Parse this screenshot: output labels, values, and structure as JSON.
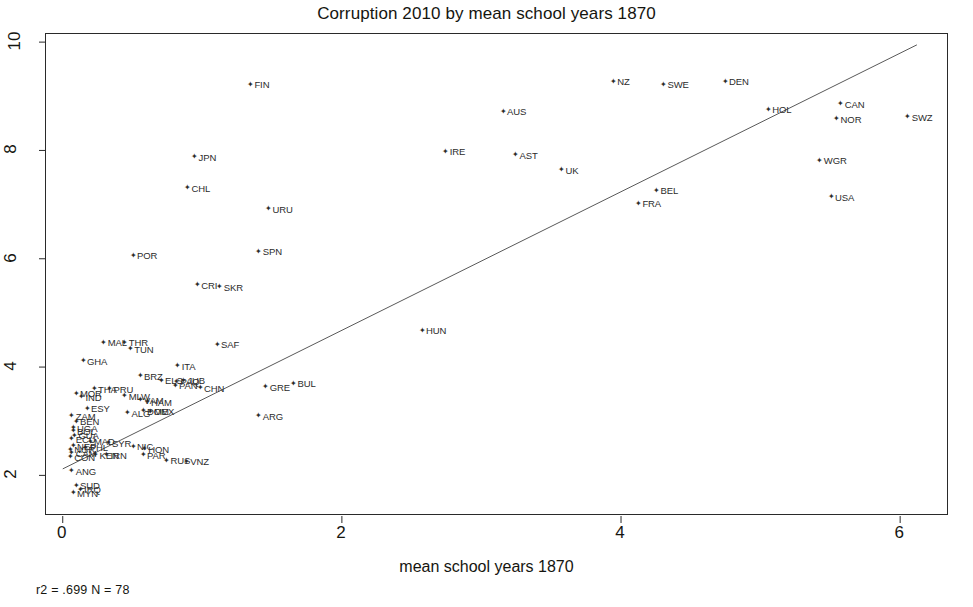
{
  "chart_data": {
    "type": "scatter",
    "title": "Corruption 2010 by mean school years 1870",
    "xlabel": "mean school years 1870",
    "ylabel": "",
    "xlim": [
      -0.12,
      6.35
    ],
    "ylim": [
      1.25,
      10.15
    ],
    "xticks": [
      0,
      2,
      4,
      6
    ],
    "yticks": [
      2,
      4,
      6,
      8,
      10
    ],
    "grid": false,
    "legend": null,
    "annotation": "r2 = .699  N = 78",
    "r2": ".699",
    "n": "78",
    "trendline": {
      "x0": 0.0,
      "y0": 2.12,
      "x1": 6.12,
      "y1": 9.95
    },
    "marker": "✦",
    "point_label_position": "right",
    "points": [
      {
        "label": "FIN",
        "x": 1.32,
        "y": 9.22
      },
      {
        "label": "NZ",
        "x": 3.92,
        "y": 9.28
      },
      {
        "label": "SWE",
        "x": 4.28,
        "y": 9.22
      },
      {
        "label": "DEN",
        "x": 4.72,
        "y": 9.28
      },
      {
        "label": "AUS",
        "x": 3.13,
        "y": 8.72
      },
      {
        "label": "HOL",
        "x": 5.03,
        "y": 8.76
      },
      {
        "label": "CAN",
        "x": 5.55,
        "y": 8.86
      },
      {
        "label": "NOR",
        "x": 5.52,
        "y": 8.58
      },
      {
        "label": "SWZ",
        "x": 6.03,
        "y": 8.62
      },
      {
        "label": "IRE",
        "x": 2.72,
        "y": 7.98
      },
      {
        "label": "AST",
        "x": 3.22,
        "y": 7.92
      },
      {
        "label": "JPN",
        "x": 0.92,
        "y": 7.88
      },
      {
        "label": "WGR",
        "x": 5.4,
        "y": 7.82
      },
      {
        "label": "UK",
        "x": 3.55,
        "y": 7.64
      },
      {
        "label": "CHL",
        "x": 0.87,
        "y": 7.31
      },
      {
        "label": "BEL",
        "x": 4.23,
        "y": 7.26
      },
      {
        "label": "USA",
        "x": 5.48,
        "y": 7.14
      },
      {
        "label": "URU",
        "x": 1.45,
        "y": 6.92
      },
      {
        "label": "FRA",
        "x": 4.1,
        "y": 7.02
      },
      {
        "label": "SPN",
        "x": 1.38,
        "y": 6.14
      },
      {
        "label": "POR",
        "x": 0.48,
        "y": 6.06
      },
      {
        "label": "CRI",
        "x": 0.94,
        "y": 5.52
      },
      {
        "label": "SKR",
        "x": 1.1,
        "y": 5.48
      },
      {
        "label": "HUN",
        "x": 2.55,
        "y": 4.68
      },
      {
        "label": "SAF",
        "x": 1.08,
        "y": 4.42
      },
      {
        "label": "MAL",
        "x": 0.27,
        "y": 4.46
      },
      {
        "label": "THR",
        "x": 0.42,
        "y": 4.46
      },
      {
        "label": "TUN",
        "x": 0.46,
        "y": 4.34
      },
      {
        "label": "GHA",
        "x": 0.12,
        "y": 4.12
      },
      {
        "label": "ITA",
        "x": 0.8,
        "y": 4.02
      },
      {
        "label": "BRZ",
        "x": 0.53,
        "y": 3.84
      },
      {
        "label": "ELS",
        "x": 0.68,
        "y": 3.76
      },
      {
        "label": "PAQ",
        "x": 0.79,
        "y": 3.74
      },
      {
        "label": "JUB",
        "x": 0.84,
        "y": 3.76
      },
      {
        "label": "BUL",
        "x": 1.63,
        "y": 3.7
      },
      {
        "label": "PAN",
        "x": 0.78,
        "y": 3.66
      },
      {
        "label": "GRE",
        "x": 1.43,
        "y": 3.64
      },
      {
        "label": "CHN",
        "x": 0.96,
        "y": 3.62
      },
      {
        "label": "THA",
        "x": 0.2,
        "y": 3.6
      },
      {
        "label": "PRU",
        "x": 0.31,
        "y": 3.6
      },
      {
        "label": "MOR",
        "x": 0.07,
        "y": 3.52
      },
      {
        "label": "IND",
        "x": 0.11,
        "y": 3.45
      },
      {
        "label": "MLW",
        "x": 0.42,
        "y": 3.47
      },
      {
        "label": "VAM",
        "x": 0.53,
        "y": 3.4
      },
      {
        "label": "HAM",
        "x": 0.58,
        "y": 3.36
      },
      {
        "label": "ESY",
        "x": 0.15,
        "y": 3.24
      },
      {
        "label": "DOM",
        "x": 0.55,
        "y": 3.19
      },
      {
        "label": "MEX",
        "x": 0.6,
        "y": 3.18
      },
      {
        "label": "ALG",
        "x": 0.44,
        "y": 3.16
      },
      {
        "label": "ARG",
        "x": 1.38,
        "y": 3.1
      },
      {
        "label": "ZAM",
        "x": 0.04,
        "y": 3.1
      },
      {
        "label": "BEN",
        "x": 0.07,
        "y": 3.0
      },
      {
        "label": "UGA",
        "x": 0.05,
        "y": 2.88
      },
      {
        "label": "BOL",
        "x": 0.05,
        "y": 2.82
      },
      {
        "label": "GUA",
        "x": 0.06,
        "y": 2.74
      },
      {
        "label": "ECU",
        "x": 0.04,
        "y": 2.68
      },
      {
        "label": "MAD",
        "x": 0.17,
        "y": 2.63
      },
      {
        "label": "SYR",
        "x": 0.3,
        "y": 2.6
      },
      {
        "label": "NIC",
        "x": 0.48,
        "y": 2.54
      },
      {
        "label": "HON",
        "x": 0.56,
        "y": 2.49
      },
      {
        "label": "NEP",
        "x": 0.05,
        "y": 2.55
      },
      {
        "label": "PHL",
        "x": 0.14,
        "y": 2.52
      },
      {
        "label": "NGR",
        "x": 0.03,
        "y": 2.48
      },
      {
        "label": "CAM",
        "x": 0.04,
        "y": 2.42
      },
      {
        "label": "KEN",
        "x": 0.21,
        "y": 2.38
      },
      {
        "label": "IRN",
        "x": 0.29,
        "y": 2.38
      },
      {
        "label": "PAR",
        "x": 0.55,
        "y": 2.38
      },
      {
        "label": "CON",
        "x": 0.03,
        "y": 2.34
      },
      {
        "label": "RUS",
        "x": 0.72,
        "y": 2.28
      },
      {
        "label": "VNZ",
        "x": 0.86,
        "y": 2.26
      },
      {
        "label": "ANG",
        "x": 0.04,
        "y": 2.08
      },
      {
        "label": "SUD",
        "x": 0.07,
        "y": 1.82
      },
      {
        "label": "IRQ",
        "x": 0.1,
        "y": 1.74
      },
      {
        "label": "MYN",
        "x": 0.05,
        "y": 1.68
      }
    ]
  }
}
